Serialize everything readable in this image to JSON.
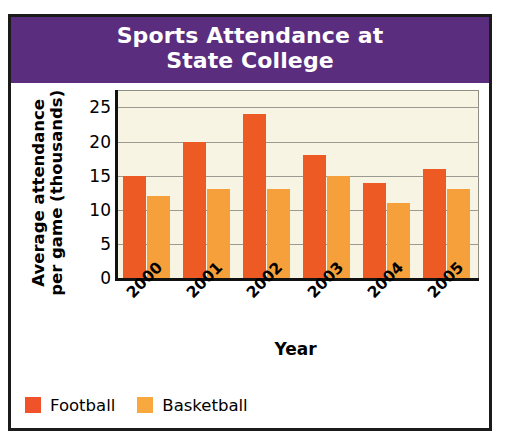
{
  "figure": {
    "title_lines": [
      "Sports Attendance at",
      "State College"
    ],
    "banner_color": "#5a2d7e",
    "plot_background": "#f8f4e4"
  },
  "axes": {
    "y_title_lines": [
      "Average attendance",
      "per game (thousands)"
    ],
    "x_title": "Year",
    "y_ticks": [
      "0",
      "5",
      "10",
      "15",
      "20",
      "25"
    ]
  },
  "legend": {
    "entries": [
      {
        "label": "Football",
        "color": "#f0522a"
      },
      {
        "label": "Basketball",
        "color": "#f7a83f"
      }
    ]
  },
  "chart_data": {
    "type": "bar",
    "title": "Sports Attendance at State College",
    "xlabel": "Year",
    "ylabel": "Average attendance per game (thousands)",
    "categories": [
      "2000",
      "2001",
      "2002",
      "2003",
      "2004",
      "2005"
    ],
    "series": [
      {
        "name": "Football",
        "color": "#ee5a24",
        "values": [
          15,
          20,
          24,
          18,
          14,
          16
        ]
      },
      {
        "name": "Basketball",
        "color": "#f5a03b",
        "values": [
          12,
          13,
          13,
          15,
          11,
          13
        ]
      }
    ],
    "ylim": [
      0,
      27.5
    ],
    "yticks": [
      0,
      5,
      10,
      15,
      20,
      25
    ],
    "grid": true,
    "legend_position": "below-left"
  }
}
